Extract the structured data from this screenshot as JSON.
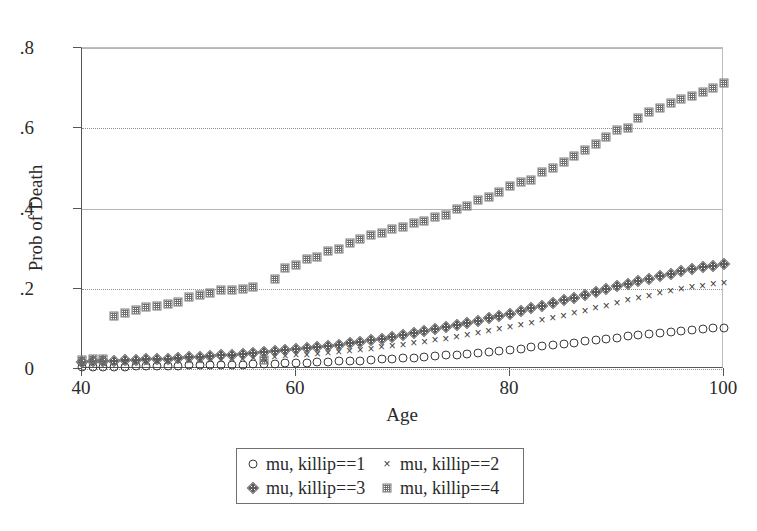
{
  "chart_data": {
    "type": "scatter",
    "title": "",
    "xlabel": "Age",
    "ylabel": "Prob of Death",
    "xlim": [
      40,
      100
    ],
    "ylim": [
      0,
      0.8
    ],
    "xticks": [
      "40",
      "60",
      "80",
      "100"
    ],
    "xtick_values": [
      40,
      60,
      80,
      100
    ],
    "yticks": [
      "0",
      ".2",
      ".4",
      ".6",
      ".8"
    ],
    "ytick_values": [
      0,
      0.2,
      0.4,
      0.6,
      0.8
    ],
    "grid": "horizontal dotted gridlines at .2 and .6, solid at .4 and .8",
    "legend_position": "below-plot",
    "series": [
      {
        "name": "mu, killip==1",
        "marker": "open-circle",
        "x": [
          40,
          41,
          42,
          43,
          44,
          45,
          46,
          47,
          48,
          49,
          50,
          51,
          52,
          53,
          54,
          55,
          56,
          57,
          58,
          59,
          60,
          61,
          62,
          63,
          64,
          65,
          66,
          67,
          68,
          69,
          70,
          71,
          72,
          73,
          74,
          75,
          76,
          77,
          78,
          79,
          80,
          81,
          82,
          83,
          84,
          85,
          86,
          87,
          88,
          89,
          90,
          91,
          92,
          93,
          94,
          95,
          96,
          97,
          98,
          99,
          100
        ],
        "y": [
          0.005,
          0.005,
          0.006,
          0.006,
          0.006,
          0.007,
          0.007,
          0.007,
          0.008,
          0.008,
          0.009,
          0.009,
          0.01,
          0.01,
          0.011,
          0.011,
          0.012,
          0.013,
          0.013,
          0.014,
          0.015,
          0.016,
          0.017,
          0.018,
          0.019,
          0.02,
          0.021,
          0.022,
          0.024,
          0.025,
          0.027,
          0.028,
          0.03,
          0.032,
          0.034,
          0.036,
          0.038,
          0.04,
          0.043,
          0.045,
          0.048,
          0.051,
          0.054,
          0.057,
          0.06,
          0.063,
          0.066,
          0.069,
          0.072,
          0.075,
          0.078,
          0.081,
          0.084,
          0.087,
          0.09,
          0.092,
          0.095,
          0.097,
          0.099,
          0.101,
          0.103
        ]
      },
      {
        "name": "mu, killip==2",
        "marker": "x-cross",
        "x": [
          40,
          41,
          42,
          43,
          44,
          45,
          46,
          47,
          48,
          49,
          50,
          51,
          52,
          53,
          54,
          55,
          56,
          57,
          58,
          59,
          60,
          61,
          62,
          63,
          64,
          65,
          66,
          67,
          68,
          69,
          70,
          71,
          72,
          73,
          74,
          75,
          76,
          77,
          78,
          79,
          80,
          81,
          82,
          83,
          84,
          85,
          86,
          87,
          88,
          89,
          90,
          91,
          92,
          93,
          94,
          95,
          96,
          97,
          98,
          99,
          100
        ],
        "y": [
          0.012,
          0.013,
          0.013,
          0.014,
          0.015,
          0.015,
          0.016,
          0.017,
          0.018,
          0.019,
          0.02,
          0.021,
          0.022,
          0.023,
          0.024,
          0.026,
          0.027,
          0.028,
          0.03,
          0.032,
          0.034,
          0.036,
          0.038,
          0.04,
          0.043,
          0.045,
          0.048,
          0.051,
          0.054,
          0.057,
          0.061,
          0.064,
          0.068,
          0.072,
          0.076,
          0.08,
          0.085,
          0.089,
          0.094,
          0.099,
          0.104,
          0.11,
          0.115,
          0.121,
          0.127,
          0.133,
          0.139,
          0.145,
          0.152,
          0.158,
          0.165,
          0.171,
          0.177,
          0.183,
          0.189,
          0.194,
          0.199,
          0.204,
          0.208,
          0.211,
          0.214
        ]
      },
      {
        "name": "mu, killip==3",
        "marker": "hatched-diamond",
        "x": [
          40,
          41,
          42,
          43,
          44,
          45,
          46,
          47,
          48,
          49,
          50,
          51,
          52,
          53,
          54,
          55,
          56,
          57,
          58,
          59,
          60,
          61,
          62,
          63,
          64,
          65,
          66,
          67,
          68,
          69,
          70,
          71,
          72,
          73,
          74,
          75,
          76,
          77,
          78,
          79,
          80,
          81,
          82,
          83,
          84,
          85,
          86,
          87,
          88,
          89,
          90,
          91,
          92,
          93,
          94,
          95,
          96,
          97,
          98,
          99,
          100
        ],
        "y": [
          0.018,
          0.019,
          0.02,
          0.021,
          0.022,
          0.023,
          0.024,
          0.025,
          0.026,
          0.028,
          0.029,
          0.031,
          0.032,
          0.034,
          0.036,
          0.038,
          0.04,
          0.042,
          0.044,
          0.047,
          0.049,
          0.052,
          0.055,
          0.058,
          0.061,
          0.065,
          0.068,
          0.072,
          0.076,
          0.08,
          0.085,
          0.089,
          0.094,
          0.099,
          0.104,
          0.109,
          0.115,
          0.12,
          0.126,
          0.132,
          0.138,
          0.145,
          0.151,
          0.158,
          0.164,
          0.171,
          0.178,
          0.185,
          0.192,
          0.199,
          0.206,
          0.212,
          0.219,
          0.225,
          0.231,
          0.237,
          0.243,
          0.248,
          0.253,
          0.257,
          0.261
        ]
      },
      {
        "name": "mu, killip==4",
        "marker": "hatched-square",
        "x": [
          40,
          41,
          42,
          43,
          44,
          45,
          46,
          47,
          48,
          49,
          50,
          51,
          52,
          53,
          54,
          55,
          56,
          57,
          58,
          59,
          60,
          61,
          62,
          63,
          64,
          65,
          66,
          67,
          68,
          69,
          70,
          71,
          72,
          73,
          74,
          75,
          76,
          77,
          78,
          79,
          80,
          81,
          82,
          83,
          84,
          85,
          86,
          87,
          88,
          89,
          90,
          91,
          92,
          93,
          94,
          95,
          96,
          97,
          98,
          99,
          100
        ],
        "y": [
          0.022,
          0.024,
          0.026,
          0.133,
          0.14,
          0.148,
          0.155,
          0.158,
          0.162,
          0.168,
          0.18,
          0.185,
          0.19,
          0.196,
          0.198,
          0.2,
          0.205,
          0.022,
          0.225,
          0.252,
          0.258,
          0.275,
          0.28,
          0.295,
          0.3,
          0.313,
          0.325,
          0.333,
          0.34,
          0.348,
          0.355,
          0.363,
          0.37,
          0.378,
          0.385,
          0.398,
          0.405,
          0.42,
          0.428,
          0.44,
          0.455,
          0.465,
          0.47,
          0.49,
          0.5,
          0.515,
          0.53,
          0.545,
          0.56,
          0.578,
          0.595,
          0.6,
          0.625,
          0.64,
          0.65,
          0.662,
          0.672,
          0.68,
          0.69,
          0.7,
          0.712
        ]
      }
    ]
  },
  "legend": {
    "entries": [
      {
        "label": "mu, killip==1",
        "marker": "open-circle"
      },
      {
        "label": "mu, killip==2",
        "marker": "x-cross"
      },
      {
        "label": "mu, killip==3",
        "marker": "hatched-diamond"
      },
      {
        "label": "mu, killip==4",
        "marker": "hatched-square"
      }
    ]
  },
  "markers": {
    "x_glyph": "×"
  }
}
